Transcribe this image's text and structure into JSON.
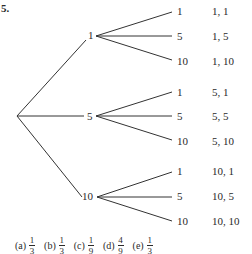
{
  "problem": {
    "number": "5."
  },
  "tree": {
    "level1": [
      {
        "label": "1",
        "children": [
          {
            "label": "1",
            "outcome": "1, 1"
          },
          {
            "label": "5",
            "outcome": "1, 5"
          },
          {
            "label": "10",
            "outcome": "1, 10"
          }
        ]
      },
      {
        "label": "5",
        "children": [
          {
            "label": "1",
            "outcome": "5, 1"
          },
          {
            "label": "5",
            "outcome": "5, 5"
          },
          {
            "label": "10",
            "outcome": "5, 10"
          }
        ]
      },
      {
        "label": "10",
        "children": [
          {
            "label": "1",
            "outcome": "10, 1"
          },
          {
            "label": "5",
            "outcome": "10, 5"
          },
          {
            "label": "10",
            "outcome": "10, 10"
          }
        ]
      }
    ]
  },
  "answers": [
    {
      "label": "(a)",
      "num": "1",
      "den": "3"
    },
    {
      "label": "(b)",
      "num": "1",
      "den": "3"
    },
    {
      "label": "(c)",
      "num": "1",
      "den": "9"
    },
    {
      "label": "(d)",
      "num": "4",
      "den": "9"
    },
    {
      "label": "(e)",
      "num": "1",
      "den": "3"
    }
  ]
}
